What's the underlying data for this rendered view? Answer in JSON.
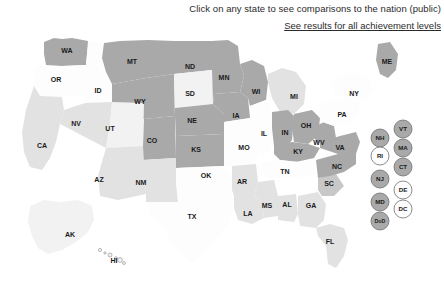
{
  "header": {
    "instruction": "Click on any state to see comparisons to the nation (public)",
    "link": "See results for all achievement levels"
  },
  "legend_colors": {
    "dark": "#a9a9a9",
    "medium": "#c8c8c8",
    "light": "#e2e2e2",
    "lightest": "#f2f2f2",
    "white": "#fdfdfd",
    "border": "#7a7a7a",
    "text": "#1a1a1a"
  },
  "chart_data": {
    "type": "map",
    "title": "Click on any state to see comparisons to the nation (public)",
    "map_kind": "us-choropleth",
    "shading_levels": [
      "white",
      "lightest",
      "light",
      "medium",
      "dark"
    ],
    "states": [
      {
        "code": "WA",
        "shade": "dark",
        "x": 67,
        "y": 27
      },
      {
        "code": "OR",
        "shade": "white",
        "x": 56,
        "y": 56
      },
      {
        "code": "ID",
        "shade": "white",
        "x": 98,
        "y": 67
      },
      {
        "code": "MT",
        "shade": "dark",
        "x": 132,
        "y": 38
      },
      {
        "code": "WY",
        "shade": "dark",
        "x": 140,
        "y": 78
      },
      {
        "code": "CA",
        "shade": "light",
        "x": 42,
        "y": 122
      },
      {
        "code": "NV",
        "shade": "light",
        "x": 76,
        "y": 100
      },
      {
        "code": "UT",
        "shade": "lightest",
        "x": 110,
        "y": 105
      },
      {
        "code": "CO",
        "shade": "dark",
        "x": 152,
        "y": 117
      },
      {
        "code": "AZ",
        "shade": "light",
        "x": 99,
        "y": 156
      },
      {
        "code": "NM",
        "shade": "light",
        "x": 141,
        "y": 159
      },
      {
        "code": "ND",
        "shade": "dark",
        "x": 190,
        "y": 43
      },
      {
        "code": "SD",
        "shade": "lightest",
        "x": 190,
        "y": 70
      },
      {
        "code": "NE",
        "shade": "dark",
        "x": 192,
        "y": 97
      },
      {
        "code": "KS",
        "shade": "dark",
        "x": 196,
        "y": 126
      },
      {
        "code": "OK",
        "shade": "white",
        "x": 206,
        "y": 152
      },
      {
        "code": "TX",
        "shade": "white",
        "x": 192,
        "y": 193
      },
      {
        "code": "MN",
        "shade": "dark",
        "x": 224,
        "y": 54
      },
      {
        "code": "IA",
        "shade": "dark",
        "x": 236,
        "y": 92
      },
      {
        "code": "MO",
        "shade": "white",
        "x": 244,
        "y": 124
      },
      {
        "code": "AR",
        "shade": "light",
        "x": 242,
        "y": 158
      },
      {
        "code": "LA",
        "shade": "light",
        "x": 248,
        "y": 190
      },
      {
        "code": "WI",
        "shade": "dark",
        "x": 256,
        "y": 68
      },
      {
        "code": "IL",
        "shade": "white",
        "x": 264,
        "y": 110
      },
      {
        "code": "MS",
        "shade": "light",
        "x": 267,
        "y": 182
      },
      {
        "code": "MI",
        "shade": "light",
        "x": 294,
        "y": 73
      },
      {
        "code": "IN",
        "shade": "dark",
        "x": 285,
        "y": 109
      },
      {
        "code": "OH",
        "shade": "dark",
        "x": 306,
        "y": 102
      },
      {
        "code": "KY",
        "shade": "dark",
        "x": 298,
        "y": 128
      },
      {
        "code": "TN",
        "shade": "white",
        "x": 285,
        "y": 148
      },
      {
        "code": "AL",
        "shade": "light",
        "x": 287,
        "y": 181
      },
      {
        "code": "GA",
        "shade": "light",
        "x": 311,
        "y": 182
      },
      {
        "code": "FL",
        "shade": "light",
        "x": 330,
        "y": 218
      },
      {
        "code": "SC",
        "shade": "medium",
        "x": 329,
        "y": 160
      },
      {
        "code": "NC",
        "shade": "dark",
        "x": 337,
        "y": 143
      },
      {
        "code": "VA",
        "shade": "dark",
        "x": 340,
        "y": 124
      },
      {
        "code": "WV",
        "shade": "dark",
        "x": 319,
        "y": 119
      },
      {
        "code": "PA",
        "shade": "white",
        "x": 342,
        "y": 91
      },
      {
        "code": "NY",
        "shade": "white",
        "x": 354,
        "y": 70
      },
      {
        "code": "ME",
        "shade": "dark",
        "x": 387,
        "y": 38
      },
      {
        "code": "AK",
        "shade": "lightest",
        "x": 70,
        "y": 211
      },
      {
        "code": "HI",
        "shade": "lightest",
        "x": 114,
        "y": 237
      }
    ],
    "bubbles": [
      {
        "code": "NH",
        "shade": "dark",
        "x": 380,
        "y": 114
      },
      {
        "code": "RI",
        "shade": "white",
        "x": 380,
        "y": 132
      },
      {
        "code": "NJ",
        "shade": "dark",
        "x": 380,
        "y": 155
      },
      {
        "code": "MD",
        "shade": "dark",
        "x": 380,
        "y": 178
      },
      {
        "code": "DoD",
        "shade": "dark",
        "x": 380,
        "y": 197
      },
      {
        "code": "VT",
        "shade": "dark",
        "x": 403,
        "y": 105
      },
      {
        "code": "MA",
        "shade": "dark",
        "x": 403,
        "y": 124
      },
      {
        "code": "CT",
        "shade": "dark",
        "x": 403,
        "y": 143
      },
      {
        "code": "DE",
        "shade": "white",
        "x": 403,
        "y": 166
      },
      {
        "code": "DC",
        "shade": "white",
        "x": 403,
        "y": 185
      }
    ]
  }
}
